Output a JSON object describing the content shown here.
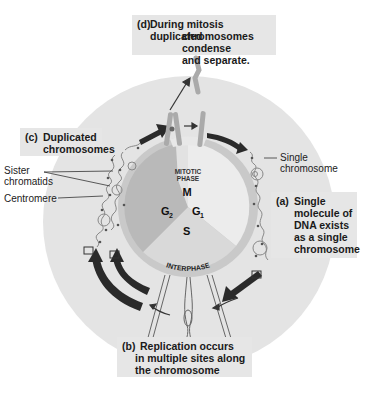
{
  "callouts": {
    "d": {
      "tag": "(d)",
      "lines": [
        "During mitosis duplicated",
        "chromosomes condense",
        "and separate."
      ]
    },
    "c": {
      "tag": "(c)",
      "lines": [
        "Duplicated",
        "chromosomes"
      ]
    },
    "a": {
      "tag": "(a)",
      "lines": [
        "Single",
        "molecule of",
        "DNA exists",
        "as a single",
        "chromosome"
      ]
    },
    "b": {
      "tag": "(b)",
      "lines": [
        "Replication occurs",
        "in multiple sites along",
        "the chromosome"
      ]
    }
  },
  "labels": {
    "sister_chromatids": [
      "Sister",
      "chromatids"
    ],
    "centromere": "Centromere",
    "single_chromosome": [
      "Single",
      "chromosome"
    ]
  },
  "cycle": {
    "mitotic_phase": [
      "MITOTIC",
      "PHASE"
    ],
    "interphase": "INTERPHASE",
    "phases": {
      "M": "M",
      "G2": "G",
      "G2_sub": "2",
      "G1": "G",
      "G1_sub": "1",
      "S": "S"
    }
  },
  "colors": {
    "outer_disc": "#e4e4e4",
    "ring": "#c9c9c9",
    "g2_sector": "#b9b9b9",
    "s_sector": "#d9d9d9",
    "g1_sector": "#ececec",
    "arrow": "#2a2a2a",
    "callout_bg": "#e6e6e6"
  }
}
